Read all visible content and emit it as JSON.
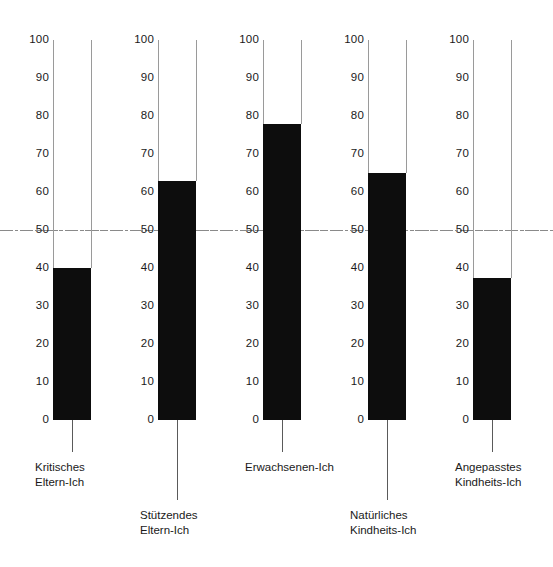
{
  "chart_data": {
    "type": "bar",
    "title": "",
    "subtitle": "",
    "xlabel": "",
    "ylabel": "",
    "ylim": [
      0,
      100
    ],
    "yticks": [
      100,
      90,
      80,
      70,
      60,
      50,
      40,
      30,
      20,
      10,
      0
    ],
    "grid": false,
    "legend": null,
    "orientation": "vertical",
    "style": "thermometer-columns",
    "reference_line": {
      "value": 50,
      "style": "dash-dot",
      "color": "#8a8a8a",
      "spans_full_width": true
    },
    "bar_color": "#0d0d0d",
    "outline_color": "#9a9a9a",
    "categories": [
      "Kritisches Eltern-Ich",
      "Stützendes Eltern-Ich",
      "Erwachsenen-Ich",
      "Natürliches Kindheits-Ich",
      "Angepasstes Kindheits-Ich"
    ],
    "values": [
      40,
      63,
      78,
      65,
      37.5
    ]
  },
  "columns": [
    {
      "name": "kritisches-eltern-ich",
      "value": 40,
      "label_lines": [
        "Kritisches",
        "Eltern-Ich"
      ],
      "label_row": "upper"
    },
    {
      "name": "stuetzendes-eltern-ich",
      "value": 63,
      "label_lines": [
        "Stützendes",
        "Eltern-Ich"
      ],
      "label_row": "lower"
    },
    {
      "name": "erwachsenen-ich",
      "value": 78,
      "label_lines": [
        "Erwachsenen-Ich"
      ],
      "label_row": "upper"
    },
    {
      "name": "natuerliches-kindheits-ich",
      "value": 65,
      "label_lines": [
        "Natürliches",
        "Kindheits-Ich"
      ],
      "label_row": "lower"
    },
    {
      "name": "angepasstes-kindheits-ich",
      "value": 37.5,
      "label_lines": [
        "Angepasstes",
        "Kindheits-Ich"
      ],
      "label_row": "upper"
    }
  ],
  "scale": {
    "ticks": [
      "100",
      "90",
      "80",
      "70",
      "60",
      "50",
      "40",
      "30",
      "20",
      "10",
      "0"
    ],
    "max": 100,
    "min": 0
  }
}
